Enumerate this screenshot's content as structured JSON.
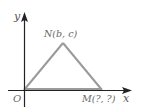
{
  "diagram": {
    "type": "coordinate-geometry-figure",
    "axes": {
      "x_label": "x",
      "y_label": "y",
      "origin_label": "O",
      "axis_color": "#222222"
    },
    "points": [
      {
        "id": "O",
        "label": "O",
        "x_px": 24,
        "y_px": 90
      },
      {
        "id": "N",
        "label": "N(b, c)",
        "x_px": 63,
        "y_px": 43
      },
      {
        "id": "M",
        "label": "M(?, ?)",
        "x_px": 102,
        "y_px": 90
      }
    ],
    "triangle": {
      "vertices": [
        "O",
        "N",
        "M"
      ],
      "stroke_color": "#9a9a9a"
    },
    "label_color": "#666666"
  }
}
